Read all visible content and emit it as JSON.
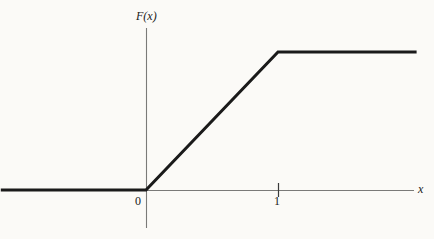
{
  "figure": {
    "background_color": "#fbfaf7",
    "ink_color": "#1a1a1a",
    "axis_color": "#6b6b6b"
  },
  "labels": {
    "y_axis_label": "F(x)",
    "x_axis_label": "x",
    "tick_zero": "0",
    "tick_one": "1"
  },
  "chart_data": {
    "type": "line",
    "title": "",
    "subtitle": "",
    "xlabel": "x",
    "ylabel": "F(x)",
    "x": [
      -1.1,
      0,
      1,
      2.05
    ],
    "y": [
      0,
      0,
      1,
      1
    ],
    "series": [
      {
        "name": "F(x)",
        "x": [
          -1.1,
          0,
          1,
          2.05
        ],
        "y": [
          0,
          0,
          1,
          1
        ],
        "linewidth": 3,
        "color": "#1a1a1a"
      }
    ],
    "xlim": [
      -1.1,
      2.25
    ],
    "ylim": [
      -0.28,
      1.17
    ],
    "xticks": [
      0,
      1
    ],
    "xticklabels": [
      "0",
      "1"
    ],
    "yticks": [],
    "yticklabels": [],
    "grid": false,
    "legend": false,
    "legend_position": "none",
    "annotations": [
      {
        "text": "F(x)",
        "x": 0,
        "y": 1.17,
        "role": "y-axis-label",
        "style": "italic"
      },
      {
        "text": "x",
        "x": 2.25,
        "y": 0,
        "role": "x-axis-label",
        "style": "italic"
      }
    ],
    "axes": {
      "x_axis": {
        "drawn": true,
        "from": [
          -1.1,
          0
        ],
        "to": [
          2.18,
          0
        ],
        "color": "#6b6b6b",
        "linewidth": 1
      },
      "y_axis": {
        "drawn": true,
        "from": [
          0,
          -0.28
        ],
        "to": [
          0,
          1.17
        ],
        "color": "#6b6b6b",
        "linewidth": 1
      }
    },
    "breakpoints": [
      {
        "x": 0,
        "y": 0,
        "type": "kink-origin"
      },
      {
        "x": 1,
        "y": 1,
        "type": "kink-plateau"
      }
    ],
    "plateau_value": 1
  },
  "geometry_px": {
    "origin": {
      "x": 146,
      "y": 190
    },
    "kink": {
      "x": 278,
      "y": 52
    },
    "curve_left_start": {
      "x": 13,
      "y": 190
    },
    "curve_right_end": {
      "x": 412,
      "y": 52
    },
    "x_axis": {
      "x1": 14,
      "x2": 414,
      "y": 190
    },
    "y_axis": {
      "x": 146,
      "y1": 28,
      "y2": 228
    },
    "tick_one": {
      "x": 278,
      "y1": 183,
      "y2": 197
    }
  }
}
